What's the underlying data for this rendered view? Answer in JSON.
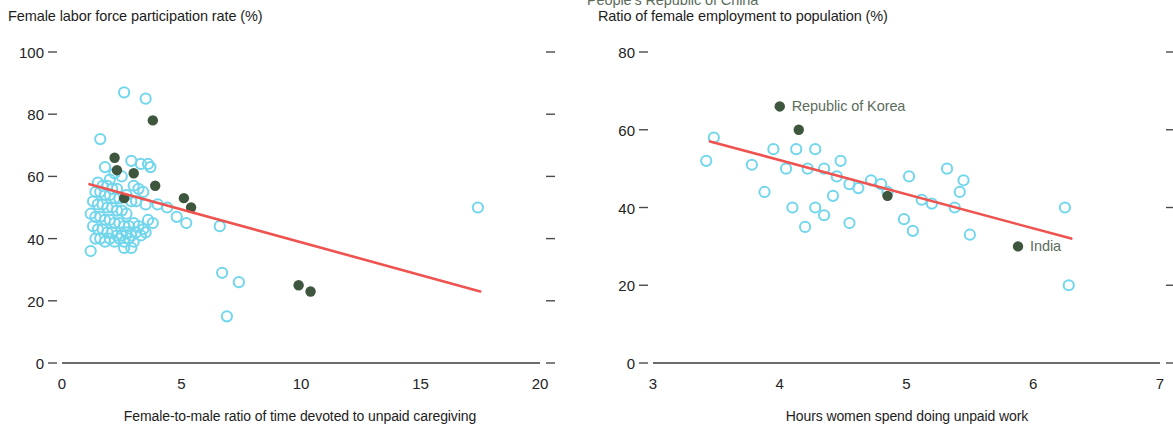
{
  "chart_data": [
    {
      "type": "scatter",
      "panel": "left",
      "title": "Female labor force participation rate (%)",
      "xlabel": "Female-to-male ratio of time devoted to unpaid caregiving",
      "ylabel": "",
      "xlim": [
        0,
        20
      ],
      "ylim": [
        0,
        100
      ],
      "xticks": [
        0,
        5,
        10,
        15,
        20
      ],
      "yticks": [
        0,
        20,
        40,
        60,
        80,
        100
      ],
      "grid": false,
      "legend": "none",
      "colors": {
        "open_marker": "#72d6ec",
        "filled_marker": "#3d563d",
        "trend_line": "#ef5350",
        "axis": "#4a4a4a"
      },
      "series": [
        {
          "name": "Other economies",
          "marker": "open-circle",
          "color": "#72d6ec",
          "points": [
            [
              2.6,
              87
            ],
            [
              3.5,
              85
            ],
            [
              1.6,
              72
            ],
            [
              2.9,
              65
            ],
            [
              3.3,
              64
            ],
            [
              3.6,
              64
            ],
            [
              3.7,
              63
            ],
            [
              1.8,
              63
            ],
            [
              2.2,
              61
            ],
            [
              2.5,
              60
            ],
            [
              2.0,
              59
            ],
            [
              1.5,
              58
            ],
            [
              1.7,
              57
            ],
            [
              1.9,
              57
            ],
            [
              2.1,
              56
            ],
            [
              2.3,
              56
            ],
            [
              1.4,
              55
            ],
            [
              1.6,
              55
            ],
            [
              1.8,
              54
            ],
            [
              2.0,
              54
            ],
            [
              2.2,
              53
            ],
            [
              2.4,
              53
            ],
            [
              3.0,
              57
            ],
            [
              3.2,
              56
            ],
            [
              3.4,
              55
            ],
            [
              2.7,
              54
            ],
            [
              2.9,
              52
            ],
            [
              1.3,
              52
            ],
            [
              1.5,
              51
            ],
            [
              1.7,
              51
            ],
            [
              1.9,
              50
            ],
            [
              2.1,
              50
            ],
            [
              2.3,
              49
            ],
            [
              2.5,
              49
            ],
            [
              2.7,
              48
            ],
            [
              3.1,
              52
            ],
            [
              3.5,
              51
            ],
            [
              4.0,
              51
            ],
            [
              4.4,
              50
            ],
            [
              1.2,
              48
            ],
            [
              1.4,
              47
            ],
            [
              1.6,
              47
            ],
            [
              1.8,
              46
            ],
            [
              2.0,
              46
            ],
            [
              2.2,
              45
            ],
            [
              2.4,
              45
            ],
            [
              2.6,
              44
            ],
            [
              2.8,
              44
            ],
            [
              3.0,
              45
            ],
            [
              3.2,
              44
            ],
            [
              3.4,
              43
            ],
            [
              3.6,
              46
            ],
            [
              3.8,
              45
            ],
            [
              1.3,
              44
            ],
            [
              1.5,
              43
            ],
            [
              1.7,
              43
            ],
            [
              1.9,
              42
            ],
            [
              2.1,
              42
            ],
            [
              2.3,
              41
            ],
            [
              2.5,
              41
            ],
            [
              2.7,
              42
            ],
            [
              2.9,
              41
            ],
            [
              3.1,
              42
            ],
            [
              3.3,
              41
            ],
            [
              3.5,
              42
            ],
            [
              1.4,
              40
            ],
            [
              1.6,
              40
            ],
            [
              1.8,
              39
            ],
            [
              2.0,
              40
            ],
            [
              2.2,
              39
            ],
            [
              2.4,
              40
            ],
            [
              2.6,
              39
            ],
            [
              2.8,
              40
            ],
            [
              3.0,
              39
            ],
            [
              1.2,
              36
            ],
            [
              2.6,
              37
            ],
            [
              2.9,
              37
            ],
            [
              4.8,
              47
            ],
            [
              5.2,
              45
            ],
            [
              6.6,
              44
            ],
            [
              6.7,
              29
            ],
            [
              7.4,
              26
            ],
            [
              6.9,
              15
            ],
            [
              17.4,
              50
            ]
          ]
        },
        {
          "name": "Selected economies",
          "marker": "filled-circle",
          "color": "#3d563d",
          "points": [
            [
              3.8,
              78
            ],
            [
              2.2,
              66
            ],
            [
              2.3,
              62
            ],
            [
              3.0,
              61
            ],
            [
              3.9,
              57
            ],
            [
              5.1,
              53
            ],
            [
              5.4,
              50
            ],
            [
              2.6,
              53
            ],
            [
              9.9,
              25
            ],
            [
              10.4,
              23
            ]
          ]
        }
      ],
      "trend_line": {
        "x": [
          1.15,
          17.5
        ],
        "y": [
          57.5,
          23
        ],
        "color": "#ef5350"
      }
    },
    {
      "type": "scatter",
      "panel": "right",
      "title": "Ratio of female employment to population (%)",
      "xlabel": "Hours women spend doing unpaid work",
      "ylabel": "",
      "xlim": [
        3,
        7
      ],
      "ylim": [
        0,
        80
      ],
      "xticks": [
        3,
        4,
        5,
        6,
        7
      ],
      "yticks": [
        0,
        20,
        40,
        60,
        80
      ],
      "grid": false,
      "legend": "none",
      "colors": {
        "open_marker": "#72d6ec",
        "filled_marker": "#3d563d",
        "trend_line": "#ef5350",
        "axis": "#4a4a4a"
      },
      "series": [
        {
          "name": "Other economies",
          "marker": "open-circle",
          "color": "#72d6ec",
          "points": [
            [
              3.48,
              58
            ],
            [
              3.42,
              52
            ],
            [
              3.78,
              51
            ],
            [
              3.95,
              55
            ],
            [
              4.13,
              55
            ],
            [
              4.28,
              55
            ],
            [
              4.05,
              50
            ],
            [
              4.22,
              50
            ],
            [
              4.35,
              50
            ],
            [
              4.45,
              48
            ],
            [
              4.48,
              52
            ],
            [
              4.55,
              46
            ],
            [
              4.62,
              45
            ],
            [
              3.88,
              44
            ],
            [
              4.1,
              40
            ],
            [
              4.28,
              40
            ],
            [
              4.35,
              38
            ],
            [
              4.42,
              43
            ],
            [
              4.55,
              36
            ],
            [
              4.2,
              35
            ],
            [
              4.72,
              47
            ],
            [
              4.8,
              46
            ],
            [
              4.85,
              44
            ],
            [
              5.02,
              48
            ],
            [
              5.12,
              42
            ],
            [
              5.2,
              41
            ],
            [
              4.98,
              37
            ],
            [
              5.32,
              50
            ],
            [
              5.45,
              47
            ],
            [
              5.42,
              44
            ],
            [
              5.38,
              40
            ],
            [
              5.5,
              33
            ],
            [
              5.05,
              34
            ],
            [
              6.25,
              40
            ],
            [
              6.28,
              20
            ]
          ]
        },
        {
          "name": "Selected economies",
          "marker": "filled-circle",
          "color": "#3d563d",
          "points": [
            [
              4.85,
              43
            ],
            [
              5.88,
              30
            ]
          ]
        }
      ],
      "trend_line": {
        "x": [
          3.45,
          6.3
        ],
        "y": [
          57,
          32
        ],
        "color": "#ef5350"
      },
      "annotations": [
        {
          "label": "Republic of Korea",
          "x": 4.0,
          "y": 66,
          "marker": "filled-circle"
        },
        {
          "label": "People's Republic of China",
          "x": 4.15,
          "y": 60,
          "marker": "filled-circle"
        },
        {
          "label": "India",
          "x": 5.88,
          "y": 30,
          "marker": "none"
        }
      ]
    }
  ],
  "left_panel": {
    "title": "Female labor force participation rate (%)",
    "x_caption": "Female-to-male ratio of time devoted to unpaid caregiving",
    "yticks": [
      "100",
      "80",
      "60",
      "40",
      "20",
      "0"
    ],
    "xticks": [
      "0",
      "5",
      "10",
      "15",
      "20"
    ]
  },
  "right_panel": {
    "title": "Ratio of female employment to population (%)",
    "x_caption": "Hours women spend doing unpaid work",
    "yticks": [
      "80",
      "60",
      "40",
      "20",
      "0"
    ],
    "xticks": [
      "3",
      "4",
      "5",
      "6",
      "7"
    ],
    "labels": {
      "korea": "Republic of Korea",
      "china": "People’s Republic of China",
      "india": "India"
    }
  }
}
